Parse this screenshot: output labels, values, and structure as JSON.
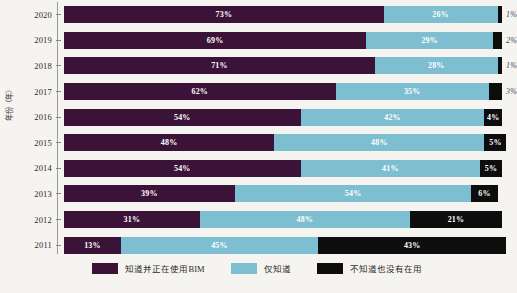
{
  "axes": {
    "y_title": "年份（年）"
  },
  "legend": {
    "items": [
      {
        "label": "知道并正在使用BIM",
        "color": "#3b1338",
        "key": "using"
      },
      {
        "label": "仅知道",
        "color": "#7dbed0",
        "key": "aware"
      },
      {
        "label": "不知道也没有在用",
        "color": "#0d0d0d",
        "key": "unaware"
      }
    ]
  },
  "chart_data": {
    "type": "bar",
    "orientation": "horizontal",
    "stacked": true,
    "stack_total": 100,
    "title": "",
    "xlabel": "",
    "ylabel": "年份（年）",
    "xlim": [
      0,
      100
    ],
    "grid": false,
    "legend_position": "bottom",
    "categories": [
      "2020",
      "2019",
      "2018",
      "2017",
      "2016",
      "2015",
      "2014",
      "2013",
      "2012",
      "2011"
    ],
    "series": [
      {
        "name": "知道并正在使用BIM",
        "color": "#3b1338",
        "values": [
          73,
          69,
          71,
          62,
          54,
          48,
          54,
          39,
          31,
          13
        ]
      },
      {
        "name": "仅知道",
        "color": "#7dbed0",
        "values": [
          26,
          29,
          28,
          35,
          42,
          48,
          41,
          54,
          48,
          45
        ]
      },
      {
        "name": "不知道也没有在用",
        "color": "#0d0d0d",
        "values": [
          1,
          2,
          1,
          3,
          4,
          5,
          5,
          6,
          21,
          43
        ]
      }
    ],
    "rows": [
      {
        "year": "2020",
        "using": "73%",
        "aware": "26%",
        "unaware": "1%",
        "unaware_outside": true
      },
      {
        "year": "2019",
        "using": "69%",
        "aware": "29%",
        "unaware": "2%",
        "unaware_outside": true
      },
      {
        "year": "2018",
        "using": "71%",
        "aware": "28%",
        "unaware": "1%",
        "unaware_outside": true
      },
      {
        "year": "2017",
        "using": "62%",
        "aware": "35%",
        "unaware": "3%",
        "unaware_outside": true
      },
      {
        "year": "2016",
        "using": "54%",
        "aware": "42%",
        "unaware": "4%",
        "unaware_outside": false
      },
      {
        "year": "2015",
        "using": "48%",
        "aware": "48%",
        "unaware": "5%",
        "unaware_outside": false
      },
      {
        "year": "2014",
        "using": "54%",
        "aware": "41%",
        "unaware": "5%",
        "unaware_outside": false
      },
      {
        "year": "2013",
        "using": "39%",
        "aware": "54%",
        "unaware": "6%",
        "unaware_outside": false
      },
      {
        "year": "2012",
        "using": "31%",
        "aware": "48%",
        "unaware": "21%",
        "unaware_outside": false
      },
      {
        "year": "2011",
        "using": "13%",
        "aware": "45%",
        "unaware": "43%",
        "unaware_outside": false
      }
    ]
  }
}
